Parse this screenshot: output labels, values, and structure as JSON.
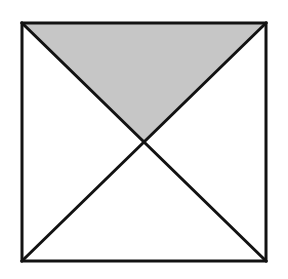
{
  "figure": {
    "description": "A square outline containing two diagonals that cross at the center, partitioning the square into four triangles. The top triangle is filled with light gray; the left, right and bottom triangles are unfilled (white).",
    "background_color": "#ffffff",
    "stroke_color": "#121212",
    "stroke_width": 3,
    "shaded_fill_color": "#c6c6c6",
    "unshaded_fill_color": "#ffffff",
    "canvas": {
      "width": 288,
      "height": 279
    },
    "square": {
      "name": "outer-square",
      "left": 22,
      "top": 23,
      "right": 266,
      "bottom": 261,
      "width": 244,
      "height": 238,
      "corners": {
        "top_left": [
          22,
          23
        ],
        "top_right": [
          266,
          23
        ],
        "bottom_right": [
          266,
          261
        ],
        "bottom_left": [
          22,
          261
        ]
      }
    },
    "center_point": {
      "name": "diagonal-intersection",
      "x": 144,
      "y": 142
    },
    "diagonals": [
      {
        "name": "diagonal-top-left-to-bottom-right",
        "from": [
          22,
          23
        ],
        "to": [
          266,
          261
        ]
      },
      {
        "name": "diagonal-top-right-to-bottom-left",
        "from": [
          266,
          23
        ],
        "to": [
          22,
          261
        ]
      }
    ],
    "regions": [
      {
        "name": "top-triangle",
        "position": "top",
        "shaded": true,
        "fill": "#c6c6c6",
        "points": "22,23 266,23 144,142"
      },
      {
        "name": "left-triangle",
        "position": "left",
        "shaded": false,
        "fill": "#ffffff",
        "points": "22,23 144,142 22,261"
      },
      {
        "name": "right-triangle",
        "position": "right",
        "shaded": false,
        "fill": "#ffffff",
        "points": "266,23 266,261 144,142"
      },
      {
        "name": "bottom-triangle",
        "position": "bottom",
        "shaded": false,
        "fill": "#ffffff",
        "points": "22,261 266,261 144,142"
      }
    ]
  }
}
